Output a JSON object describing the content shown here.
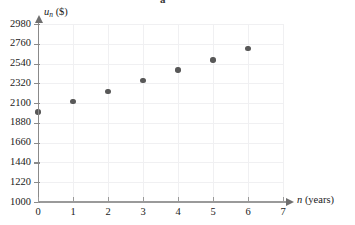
{
  "stray_glyph": "a",
  "chart_data": {
    "type": "scatter",
    "title": "",
    "subtitle": "",
    "xlabel": "n (years)",
    "xlabel_var": "n",
    "xlabel_unit": "(years)",
    "ylabel": "u_n ($)",
    "ylabel_var": "u",
    "ylabel_sub": "n",
    "ylabel_unit": "($)",
    "grid": true,
    "legend": "none",
    "xlim": [
      0,
      7
    ],
    "ylim": [
      1000,
      2980
    ],
    "xticks": [
      0,
      1,
      2,
      3,
      4,
      5,
      6,
      7
    ],
    "xtick_labels": [
      "0",
      "1",
      "2",
      "3",
      "4",
      "5",
      "6",
      "7"
    ],
    "yticks": [
      1000,
      1220,
      1440,
      1660,
      1880,
      2100,
      2320,
      2540,
      2760,
      2980
    ],
    "ytick_labels": [
      "1000",
      "1220",
      "1440",
      "1660",
      "1880",
      "2100",
      "2320",
      "2540",
      "2760",
      "2980"
    ],
    "ytick_step": 220,
    "x": [
      0,
      1,
      2,
      3,
      4,
      5,
      6
    ],
    "y": [
      2000,
      2120,
      2230,
      2350,
      2470,
      2580,
      2710
    ],
    "point_color": "#585858",
    "grid_color": "#f0f0f2",
    "axis_color": "#8a8a8a"
  }
}
